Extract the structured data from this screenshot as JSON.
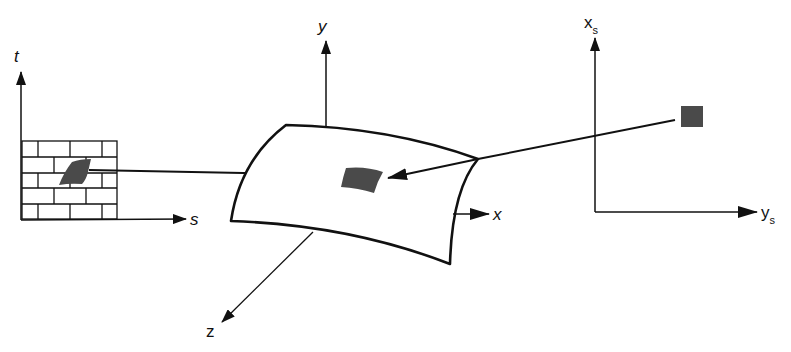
{
  "diagram": {
    "type": "texture-mapping",
    "colors": {
      "line": "#111111",
      "patch": "#4a4a4a",
      "background": "#ffffff"
    },
    "texture_space": {
      "axis_vertical_label": "t",
      "axis_horizontal_label": "s",
      "pattern": "brick"
    },
    "object_space": {
      "axis_x_label": "x",
      "axis_y_label": "y",
      "axis_z_label": "z",
      "surface": "curved-patch"
    },
    "screen_space": {
      "axis_vertical_label": "x",
      "axis_vertical_subscript": "s",
      "axis_horizontal_label": "y",
      "axis_horizontal_subscript": "s",
      "pixel": "square"
    }
  }
}
